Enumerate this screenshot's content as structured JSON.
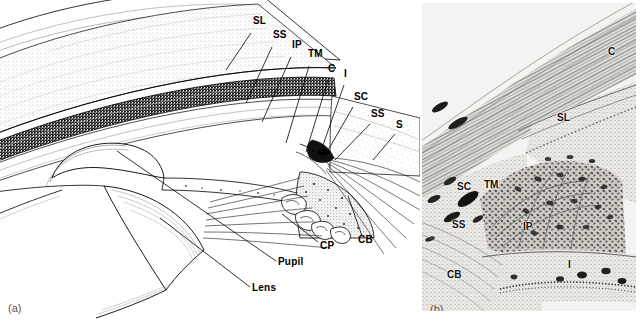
{
  "figure": {
    "type": "anatomical-illustration",
    "panels": [
      {
        "id": "a",
        "letter": "(a)",
        "kind": "line-drawing",
        "description": "Schematic sagittal drawing of the anterior segment showing cornea, iris, ciliary body, lens and drainage angle",
        "labels": [
          {
            "text": "SL",
            "meaning": "Schwalbe's line",
            "x": 253,
            "y": 24,
            "leader": [
              [
                251,
                33
              ],
              [
                226,
                70
              ]
            ]
          },
          {
            "text": "SS",
            "meaning": "scleral spur",
            "x": 273,
            "y": 38,
            "leader": [
              [
                272,
                47
              ],
              [
                246,
                103
              ]
            ]
          },
          {
            "text": "IP",
            "meaning": "iris process",
            "x": 292,
            "y": 48,
            "leader": [
              [
                291,
                57
              ],
              [
                262,
                122
              ]
            ]
          },
          {
            "text": "TM",
            "meaning": "trabecular meshwork",
            "x": 308,
            "y": 57,
            "leader": [
              [
                309,
                66
              ],
              [
                286,
                143
              ]
            ]
          },
          {
            "text": "C",
            "meaning": "cornea",
            "x": 328,
            "y": 72,
            "leader": [
              [
                328,
                80
              ],
              [
                306,
                152
              ]
            ]
          },
          {
            "text": "I",
            "meaning": "iris",
            "x": 344,
            "y": 77,
            "leader": [
              [
                344,
                85
              ],
              [
                322,
                148
              ]
            ]
          },
          {
            "text": "SC",
            "meaning": "Schlemm's canal",
            "x": 354,
            "y": 100,
            "leader": [
              [
                353,
                107
              ],
              [
                327,
                152
              ]
            ]
          },
          {
            "text": "SS",
            "meaning": "scleral spur",
            "x": 371,
            "y": 117,
            "leader": [
              [
                370,
                124
              ],
              [
                335,
                160
              ]
            ]
          },
          {
            "text": "S",
            "meaning": "sclera",
            "x": 396,
            "y": 128,
            "leader": [
              [
                395,
                134
              ],
              [
                373,
                160
              ]
            ]
          },
          {
            "text": "CB",
            "meaning": "ciliary body",
            "x": 358,
            "y": 243,
            "leader": [
              [
                362,
                236
              ],
              [
                348,
                196
              ]
            ]
          },
          {
            "text": "CP",
            "meaning": "ciliary processes",
            "x": 320,
            "y": 249,
            "leader": [
              [
                318,
                242
              ],
              [
                282,
                214
              ]
            ]
          },
          {
            "text": "Pupil",
            "meaning": "pupil",
            "x": 278,
            "y": 265,
            "leader": [
              [
                276,
                261
              ],
              [
                117,
                151
              ]
            ]
          },
          {
            "text": "Lens",
            "meaning": "lens",
            "x": 252,
            "y": 291,
            "leader": [
              [
                250,
                287
              ],
              [
                160,
                218
              ]
            ]
          }
        ]
      },
      {
        "id": "b",
        "letter": "(b)",
        "kind": "photomicrograph",
        "description": "Light micrograph of the drainage angle showing corneal stroma, Schwalbe's line, Schlemm's canal, trabecular meshwork, scleral spur, iris process, ciliary body and iris root",
        "labels": [
          {
            "text": "C",
            "meaning": "cornea",
            "x": 608,
            "y": 55
          },
          {
            "text": "SL",
            "meaning": "Schwalbe's line",
            "x": 557,
            "y": 121
          },
          {
            "text": "SC",
            "meaning": "Schlemm's canal",
            "x": 457,
            "y": 190
          },
          {
            "text": "TM",
            "meaning": "trabecular meshwork",
            "x": 484,
            "y": 188
          },
          {
            "text": "SS",
            "meaning": "scleral spur",
            "x": 452,
            "y": 228
          },
          {
            "text": "IP",
            "meaning": "iris process",
            "x": 523,
            "y": 230
          },
          {
            "text": "I",
            "meaning": "iris",
            "x": 568,
            "y": 268
          },
          {
            "text": "CB",
            "meaning": "ciliary body",
            "x": 447,
            "y": 278
          }
        ]
      }
    ],
    "colors": {
      "background": "#ffffff",
      "ink": "#000000",
      "panel_letter": "#555555",
      "micrograph_base": "#f2f2f0"
    }
  }
}
